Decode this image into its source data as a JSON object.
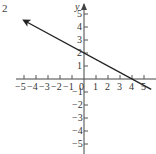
{
  "problem_label": "2",
  "chart_data": {
    "type": "line",
    "title": "",
    "xlabel": "x",
    "ylabel": "y",
    "xlim": [
      -5.5,
      5.5
    ],
    "ylim": [
      -5.5,
      5.5
    ],
    "grid": false,
    "x_ticks": [
      -5,
      -4,
      -3,
      -2,
      -1,
      0,
      1,
      2,
      3,
      4,
      5
    ],
    "y_ticks": [
      -5,
      -4,
      -3,
      -2,
      -1,
      1,
      2,
      3,
      4,
      5
    ],
    "x_tick_labels": [
      "−5",
      "−4",
      "−3",
      "−2",
      "−1",
      "0",
      "1",
      "2",
      "3",
      "4",
      "5"
    ],
    "y_tick_labels": [
      "−5",
      "−4",
      "−3",
      "−2",
      "−1",
      "1",
      "2",
      "3",
      "4",
      "5"
    ],
    "series": [
      {
        "name": "line",
        "equation": "y = -x/2 + 2",
        "x": [
          -5,
          0,
          4,
          5.6
        ],
        "y": [
          4.5,
          2,
          0,
          -0.8
        ],
        "arrows": "both"
      }
    ],
    "intercepts": {
      "y_intercept": 2,
      "x_intercept": 4
    }
  }
}
